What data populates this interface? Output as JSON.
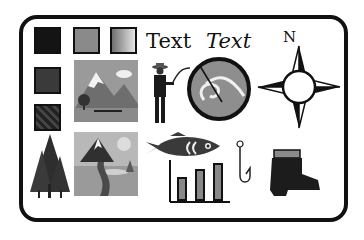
{
  "sheet": {
    "text_labels": [
      {
        "label": "Text",
        "style": "regular"
      },
      {
        "label": "Text",
        "style": "italic"
      }
    ],
    "compass_label": "N",
    "swatches": [
      {
        "name": "black-swatch",
        "color": "#141414"
      },
      {
        "name": "gray-swatch",
        "color": "#8a8a8a"
      },
      {
        "name": "gradient-swatch",
        "from": "#707070",
        "to": "#e6e6e6"
      },
      {
        "name": "dark-gray-swatch",
        "color": "#3a3a3a"
      },
      {
        "name": "pattern-swatch",
        "color": "#2a2a2a"
      }
    ],
    "icons": [
      "mountain-lake-image",
      "mountain-path-image",
      "pine-tree-icon",
      "fisherman-icon",
      "fishing-lure-circle-icon",
      "compass-rose-icon",
      "fish-icon",
      "fishing-hook-icon",
      "bar-chart-icon",
      "boot-icon"
    ]
  }
}
